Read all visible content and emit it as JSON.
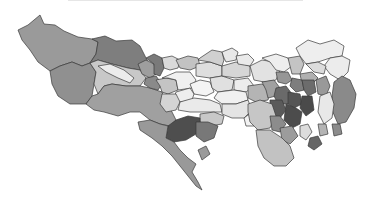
{
  "map": {
    "type": "choropleth",
    "subject": "Tokyo municipalities",
    "palette": {
      "lightest": "#f2f2f2",
      "light": "#dcdcdc",
      "light_mid": "#c4c4c4",
      "mid": "#a8a8a8",
      "mid_dark": "#8e8e8e",
      "dark": "#767676",
      "darkest": "#4a4a4a",
      "border": "#3a3a3a",
      "background": "#ffffff"
    },
    "regions": [
      {
        "id": "okutama",
        "fill": "#9a9a9a",
        "points": "18,30 28,25 40,15 44,24 55,25 64,31 78,37 92,39 98,42 96,54 90,63 82,66 72,62 60,66 50,71 38,62 30,50 22,40"
      },
      {
        "id": "ome",
        "fill": "#7e7e7e",
        "points": "92,39 105,36 116,41 132,40 140,46 146,58 150,66 140,70 128,68 112,64 98,60 90,63 96,54 98,42"
      },
      {
        "id": "hinohara",
        "fill": "#909090",
        "points": "50,71 60,66 72,62 82,66 90,63 96,72 94,84 92,96 86,104 70,104 58,96 52,84"
      },
      {
        "id": "akiruno",
        "fill": "#c8c8c8",
        "points": "90,63 98,60 112,64 128,68 140,70 146,78 140,86 126,86 112,84 104,86 98,94 94,84 96,72"
      },
      {
        "id": "hinode",
        "fill": "#ececec",
        "points": "98,66 110,64 124,70 134,78 130,83 118,78 106,72"
      },
      {
        "id": "hachioji",
        "fill": "#a0a0a0",
        "points": "92,96 98,94 104,86 112,84 126,86 140,86 150,88 162,92 166,102 172,112 176,120 170,126 160,124 150,120 140,112 130,112 118,116 104,112 94,110 86,104"
      },
      {
        "id": "mizuho",
        "fill": "#9e9e9e",
        "points": "138,64 146,60 154,64 156,74 150,78 142,74"
      },
      {
        "id": "hamura",
        "fill": "#7a7a7a",
        "points": "146,58 154,54 162,58 164,68 160,76 154,74 154,64"
      },
      {
        "id": "fussa",
        "fill": "#8a8a8a",
        "points": "146,78 156,76 162,84 158,90 150,88 144,84"
      },
      {
        "id": "musashimurayama",
        "fill": "#dadada",
        "points": "162,58 172,56 180,60 178,68 170,70 164,68"
      },
      {
        "id": "higashiyamato",
        "fill": "#c2c2c2",
        "points": "176,60 188,56 198,58 200,66 190,70 180,68"
      },
      {
        "id": "akishima",
        "fill": "#c4c4c4",
        "points": "156,80 166,78 176,80 178,90 168,94 162,92 160,86"
      },
      {
        "id": "tachikawa",
        "fill": "#f0f0f0",
        "points": "162,78 176,72 190,72 196,80 192,88 178,90 176,80 168,78"
      },
      {
        "id": "kodaira",
        "fill": "#dedede",
        "points": "196,64 210,62 222,66 222,76 210,78 196,76"
      },
      {
        "id": "higashimurayama",
        "fill": "#d0d0d0",
        "points": "200,58 212,50 222,52 224,60 222,66 210,62 198,60"
      },
      {
        "id": "kiyose",
        "fill": "#e8e8e8",
        "points": "222,52 232,48 238,52 236,60 226,62 224,58"
      },
      {
        "id": "kokubunji",
        "fill": "#f4f4f4",
        "points": "190,84 200,80 210,82 214,92 206,96 194,94"
      },
      {
        "id": "kunitachi",
        "fill": "#eeeeee",
        "points": "176,92 190,88 194,94 192,100 180,102 174,98"
      },
      {
        "id": "hino",
        "fill": "#d4d4d4",
        "points": "162,94 176,94 180,102 176,110 166,112 160,104"
      },
      {
        "id": "fuchu",
        "fill": "#eaeaea",
        "points": "180,102 194,98 210,100 220,104 222,112 206,112 190,112 178,110"
      },
      {
        "id": "koganei",
        "fill": "#e0e0e0",
        "points": "210,78 222,76 234,80 232,90 218,92 212,88"
      },
      {
        "id": "nishitokyo",
        "fill": "#d6d6d6",
        "points": "222,66 236,62 250,66 250,76 236,78 222,76"
      },
      {
        "id": "higashikurume",
        "fill": "#eaeaea",
        "points": "236,56 248,54 254,60 250,66 238,64"
      },
      {
        "id": "musashino",
        "fill": "#ececec",
        "points": "234,80 248,78 254,86 246,92 234,90"
      },
      {
        "id": "mitaka",
        "fill": "#f0f0f0",
        "points": "218,92 234,90 246,92 248,100 236,104 222,104 214,98"
      },
      {
        "id": "chofu",
        "fill": "#e4e4e4",
        "points": "222,104 236,104 248,100 252,110 244,118 232,118 222,114"
      },
      {
        "id": "komae",
        "fill": "#f2f2f2",
        "points": "244,118 252,112 258,118 254,126 246,126"
      },
      {
        "id": "inagi",
        "fill": "#c8c8c8",
        "points": "200,114 214,112 224,116 222,124 210,126 200,122"
      },
      {
        "id": "tama",
        "fill": "#4e4e4e",
        "points": "168,126 176,120 188,116 200,118 200,126 196,134 186,140 174,142 166,138"
      },
      {
        "id": "machida_n",
        "fill": "#787878",
        "points": "196,122 208,122 218,126 214,138 204,142 196,136"
      },
      {
        "id": "machida",
        "fill": "#999999",
        "points": "150,120 160,124 168,126 166,138 174,142 180,150 188,158 196,164 192,172 198,182 202,190 196,186 188,176 180,166 172,156 162,146 152,138 140,130 138,122"
      },
      {
        "id": "machida_tip",
        "fill": "#9a9a9a",
        "points": "198,150 206,146 210,154 202,160"
      },
      {
        "id": "nerima",
        "fill": "#e2e2e2",
        "points": "250,66 262,60 274,62 280,70 276,80 264,82 254,80"
      },
      {
        "id": "itabashi",
        "fill": "#eeeeee",
        "points": "262,58 276,54 288,58 292,66 284,72 276,70 270,62"
      },
      {
        "id": "kita",
        "fill": "#c4c4c4",
        "points": "288,58 300,56 304,64 300,74 292,74 290,66"
      },
      {
        "id": "adachi",
        "fill": "#eeeeee",
        "points": "296,48 308,40 320,44 334,40 344,46 342,56 330,58 318,62 306,64 300,56"
      },
      {
        "id": "katsushika",
        "fill": "#ececec",
        "points": "330,58 342,56 350,60 348,72 340,80 330,74 324,66"
      },
      {
        "id": "edogawa",
        "fill": "#8a8a8a",
        "points": "334,82 342,76 350,80 356,94 354,108 346,122 338,124 332,110 332,96"
      },
      {
        "id": "arakawa",
        "fill": "#b0b0b0",
        "points": "300,74 312,72 318,78 312,84 302,84"
      },
      {
        "id": "adachi_s",
        "fill": "#dcdcdc",
        "points": "306,64 318,62 326,66 324,74 314,72"
      },
      {
        "id": "sumida",
        "fill": "#999999",
        "points": "316,80 326,76 330,86 326,96 318,94"
      },
      {
        "id": "koto",
        "fill": "#e8e8e8",
        "points": "320,96 330,92 334,104 332,118 324,124 318,112"
      },
      {
        "id": "suginami",
        "fill": "#b4b4b4",
        "points": "248,86 262,84 270,90 268,100 256,102 248,98"
      },
      {
        "id": "nakano",
        "fill": "#a0a0a0",
        "points": "262,82 274,80 280,88 276,96 268,98 266,90"
      },
      {
        "id": "toshima",
        "fill": "#969696",
        "points": "276,72 288,72 292,80 286,84 278,82"
      },
      {
        "id": "bunkyo",
        "fill": "#7e7e7e",
        "points": "292,78 302,80 304,90 296,92 290,86"
      },
      {
        "id": "taito",
        "fill": "#6c6c6c",
        "points": "302,80 314,80 316,92 308,96 304,90"
      },
      {
        "id": "shinjuku",
        "fill": "#6a6a6a",
        "points": "276,88 286,86 292,94 288,104 278,104 274,96"
      },
      {
        "id": "chiyoda",
        "fill": "#555555",
        "points": "288,92 300,94 302,104 294,108 288,104"
      },
      {
        "id": "chuo",
        "fill": "#4a4a4a",
        "points": "302,96 312,96 314,110 306,116 300,108"
      },
      {
        "id": "minato",
        "fill": "#4c4c4c",
        "points": "286,104 296,108 302,112 300,124 292,128 284,120"
      },
      {
        "id": "shibuya",
        "fill": "#5a5a5a",
        "points": "270,100 282,100 286,110 280,118 270,114"
      },
      {
        "id": "setagaya",
        "fill": "#c6c6c6",
        "points": "248,104 260,100 272,104 276,116 270,128 258,130 250,122 248,112"
      },
      {
        "id": "meguro",
        "fill": "#8c8c8c",
        "points": "270,116 280,116 286,124 280,132 272,130"
      },
      {
        "id": "shinagawa",
        "fill": "#9c9c9c",
        "points": "280,128 292,126 298,136 290,144 282,140"
      },
      {
        "id": "ota",
        "fill": "#c2c2c2",
        "points": "256,130 270,130 282,138 290,146 294,158 286,166 274,166 264,158 258,146"
      },
      {
        "id": "bay_island",
        "fill": "#dcdcdc",
        "points": "300,126 308,124 312,132 306,140 300,136"
      },
      {
        "id": "odaiba",
        "fill": "#666666",
        "points": "310,138 318,136 322,144 314,150 308,146"
      },
      {
        "id": "koto_s",
        "fill": "#b4b4b4",
        "points": "318,124 326,124 328,134 320,136"
      },
      {
        "id": "edogawa_s",
        "fill": "#8c8c8c",
        "points": "332,124 340,124 342,134 334,136"
      }
    ]
  }
}
